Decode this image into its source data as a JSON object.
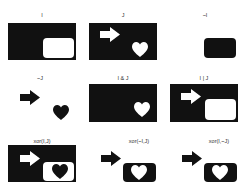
{
  "figure": {
    "background": "#ffffff",
    "foreground": "#111111",
    "panels": [
      {
        "id": "I",
        "label": "I"
      },
      {
        "id": "J",
        "label": "J"
      },
      {
        "id": "not_I",
        "label": "~I"
      },
      {
        "id": "not_J",
        "label": "~J"
      },
      {
        "id": "I_and_J",
        "label": "I & J"
      },
      {
        "id": "I_or_J",
        "label": "I | J"
      },
      {
        "id": "xor_I_J",
        "label": "xor(I,J)"
      },
      {
        "id": "xor_notI_J",
        "label": "xor(~I,J)"
      },
      {
        "id": "xor_I_notJ",
        "label": "xor(I,~J)"
      }
    ]
  }
}
